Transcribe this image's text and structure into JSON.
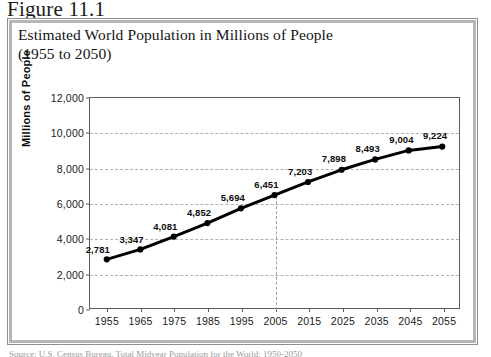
{
  "figure": {
    "caption": "Figure 11.1",
    "title_line1": "Estimated World Population in Millions of People",
    "title_line2": "(1955 to 2050)",
    "source_note": "Source: U.S. Census Bureau, Total Midyear Population for the World: 1950-2050"
  },
  "colors": {
    "line": "#000000",
    "marker": "#000000",
    "gridline": "#b0b0b0",
    "axis": "#5c5c5c",
    "frame_outer": "#8f8f8f",
    "frame_inner": "#b6b6b6",
    "text": "#141414"
  },
  "chart_data": {
    "type": "line",
    "title": "Estimated World Population in Millions of People (1955 to 2050)",
    "xlabel": "",
    "ylabel": "Millions of People",
    "categories": [
      "1955",
      "1965",
      "1975",
      "1985",
      "1995",
      "2005",
      "2015",
      "2025",
      "2035",
      "2045",
      "2055"
    ],
    "x": [
      1955,
      1965,
      1975,
      1985,
      1995,
      2005,
      2015,
      2025,
      2035,
      2045,
      2055
    ],
    "values": [
      2781,
      3347,
      4081,
      4852,
      5694,
      6451,
      7203,
      7898,
      8493,
      9004,
      9224
    ],
    "point_labels": [
      "2,781",
      "3,347",
      "4,081",
      "4,852",
      "5,694",
      "6,451",
      "7,203",
      "7,898",
      "8,493",
      "9,004",
      "9,224"
    ],
    "ylim": [
      0,
      12000
    ],
    "yticks": [
      0,
      2000,
      4000,
      6000,
      8000,
      10000,
      12000
    ],
    "ytick_labels": [
      "0",
      "2,000",
      "4,000",
      "6,000",
      "8,000",
      "10,000",
      "12,000"
    ],
    "xlim": [
      1950,
      2060
    ],
    "grid": "horizontal-dashed",
    "legend": "none",
    "annotations": [
      {
        "name": "reference-line-2005",
        "type": "vertical-dashed-line",
        "x": 2005,
        "from": 0,
        "to": 6451
      }
    ],
    "marker": "circle-filled",
    "series": [
      {
        "name": "World Population",
        "values": [
          2781,
          3347,
          4081,
          4852,
          5694,
          6451,
          7203,
          7898,
          8493,
          9004,
          9224
        ]
      }
    ]
  }
}
